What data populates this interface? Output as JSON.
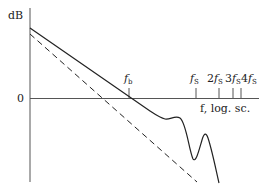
{
  "diagram": {
    "y_axis_label": "dB",
    "zero_label": "0",
    "x_axis_label": "f, log. sc.",
    "ticks": [
      {
        "coef": "",
        "sym": "f",
        "sub": "b",
        "x": 129
      },
      {
        "coef": "",
        "sym": "f",
        "sub": "S",
        "x": 196
      },
      {
        "coef": "2",
        "sym": "f",
        "sub": "S",
        "x": 219
      },
      {
        "coef": "3",
        "sym": "f",
        "sub": "S",
        "x": 233
      },
      {
        "coef": "4",
        "sym": "f",
        "sub": "S",
        "x": 241
      }
    ],
    "curves": [
      {
        "name": "actual-response",
        "style": "solid"
      },
      {
        "name": "asymptote",
        "style": "dashed"
      }
    ],
    "colors": {
      "line": "#222222",
      "axis": "#555555"
    }
  }
}
